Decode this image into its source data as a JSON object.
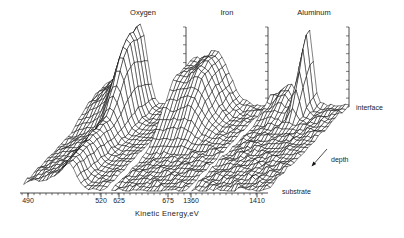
{
  "chart_data": {
    "type": "surface",
    "variant": "3d-waterfall-depth-profile",
    "xlabel": "Kinetic Energy,eV",
    "depth_axis": {
      "label": "depth",
      "back": "interface",
      "front": "substrate"
    },
    "x_ticks": [
      {
        "label": "490",
        "x": 28
      },
      {
        "label": "520",
        "x": 101
      },
      {
        "label": "625",
        "x": 119
      },
      {
        "label": "675",
        "x": 168
      },
      {
        "label": "1360",
        "x": 191
      },
      {
        "label": "1410",
        "x": 257
      }
    ],
    "panels": [
      {
        "element": "Oxygen",
        "window_eV": [
          490,
          520
        ],
        "peak_eV": 505,
        "x0": 24,
        "w": 80,
        "shape": "peak_tail",
        "a0": 27,
        "a1": 82,
        "r0": 0.52,
        "r1": 0.33,
        "mu": 0.58,
        "muShift": -0.14,
        "sg": 0.085,
        "tl": 0.5,
        "na": 1.1,
        "label_x": 143
      },
      {
        "element": "Iron",
        "window_eV": [
          625,
          675
        ],
        "peak_eV": 650,
        "x0": 112,
        "w": 74,
        "shape": "edge_plateau",
        "a0": 0,
        "a1": 58,
        "r0": 0.38,
        "r1": 0.45,
        "mu": 0.5,
        "muShift": 0,
        "sg": 0.075,
        "tl": 0,
        "na": 1.6,
        "label_x": 227
      },
      {
        "element": "Aluminum",
        "window_eV": [
          1360,
          1410
        ],
        "peak_eV": 1393,
        "x0": 192,
        "w": 75,
        "shape": "sharp_peak",
        "a0": 0,
        "a1": 78,
        "r0": 0.68,
        "r1": 0.32,
        "mu": 0.47,
        "muShift": 0,
        "sg": 0.052,
        "tl": 0.15,
        "na": 2.0,
        "label_x": 314
      }
    ],
    "rows": 25,
    "cols": 22,
    "projection": {
      "dx": 82,
      "dy": 85,
      "base_y": 190
    },
    "axis": {
      "y": 193,
      "x_start": 20,
      "x_end": 268,
      "minor_step": 6
    },
    "intensity_axes": {
      "y_top": 27,
      "y_bottom": 107,
      "n_ticks": 10,
      "tick_len": 3
    },
    "depth_arrow": {
      "x1": 327,
      "y1": 149,
      "x2": 311.5,
      "y2": 166.5
    },
    "colors": {
      "line": "#1a1a1a",
      "bg": "#ffffff",
      "text": "#1d1d1d"
    }
  }
}
